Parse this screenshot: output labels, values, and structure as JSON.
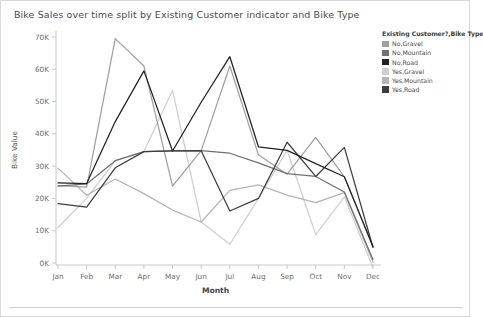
{
  "title": "Bike Sales over time split by Existing Customer indicator and Bike Type",
  "legend": {
    "title": "Existing Customer?,Bike Type",
    "items": [
      {
        "label": "No,Gravel",
        "color": "#a0a0a0"
      },
      {
        "label": "No,Mountain",
        "color": "#707070"
      },
      {
        "label": "No,Road",
        "color": "#222222"
      },
      {
        "label": "Yes,Gravel",
        "color": "#cfcfcf"
      },
      {
        "label": "Yes,Mountain",
        "color": "#b4b4b4"
      },
      {
        "label": "Yes,Road",
        "color": "#3d3d3d"
      }
    ]
  },
  "chart_data": {
    "type": "line",
    "title": "Bike Sales over time split by Existing Customer indicator and Bike Type",
    "xlabel": "Month",
    "ylabel": "Bike Value",
    "categories": [
      "Jan",
      "Feb",
      "Mar",
      "Apr",
      "May",
      "Jun",
      "Jul",
      "Aug",
      "Sep",
      "Oct",
      "Nov",
      "Dec"
    ],
    "ylim": [
      0,
      70000
    ],
    "yticks": [
      0,
      10000,
      20000,
      30000,
      40000,
      50000,
      60000,
      70000
    ],
    "ytick_labels": [
      "0K",
      "10K",
      "20K",
      "30K",
      "40K",
      "50K",
      "60K",
      "70K"
    ],
    "grid": false,
    "legend_position": "right",
    "series": [
      {
        "name": "No,Gravel",
        "color": "#a0a0a0",
        "values": [
          24000,
          23500,
          69500,
          61000,
          23800,
          34800,
          61000,
          33500,
          27500,
          38900,
          26700,
          5200
        ]
      },
      {
        "name": "No,Mountain",
        "color": "#707070",
        "values": [
          23800,
          24500,
          31700,
          34500,
          34700,
          34800,
          34000,
          31000,
          27700,
          26800,
          22000,
          1000
        ]
      },
      {
        "name": "No,Road",
        "color": "#222222",
        "values": [
          24800,
          24600,
          43800,
          59500,
          34700,
          49800,
          63900,
          36000,
          34900,
          30800,
          26700,
          5000
        ]
      },
      {
        "name": "Yes,Gravel",
        "color": "#cfcfcf",
        "values": [
          11000,
          20000,
          31700,
          34500,
          53500,
          12700,
          5800,
          20000,
          34900,
          8800,
          20500,
          -1500
        ]
      },
      {
        "name": "Yes,Mountain",
        "color": "#b4b4b4",
        "values": [
          29400,
          21000,
          26000,
          21500,
          16400,
          12700,
          22500,
          24200,
          21000,
          18700,
          21800,
          200
        ]
      },
      {
        "name": "Yes,Road",
        "color": "#3d3d3d",
        "values": [
          18400,
          17300,
          29500,
          34500,
          34700,
          34800,
          16100,
          20000,
          37400,
          26800,
          35800,
          4800
        ]
      }
    ]
  }
}
